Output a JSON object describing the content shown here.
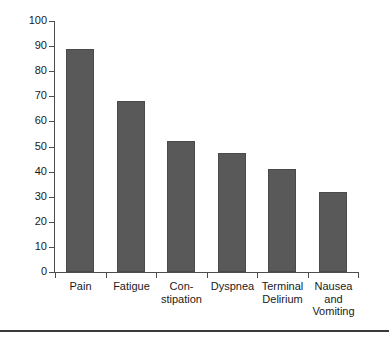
{
  "chart_data": {
    "type": "bar",
    "title": "",
    "subtitle": "",
    "xlabel": "",
    "ylabel": "",
    "categories": [
      "Pain",
      "Fatigue",
      "Con-\nstipation",
      "Dyspnea",
      "Terminal\nDelirium",
      "Nausea\nand\nVomiting"
    ],
    "category_lines": [
      [
        "Pain"
      ],
      [
        "Fatigue"
      ],
      [
        "Con-",
        "stipation"
      ],
      [
        "Dyspnea"
      ],
      [
        "Terminal",
        "Delirium"
      ],
      [
        "Nausea",
        "and",
        "Vomiting"
      ]
    ],
    "values": [
      89,
      68,
      52,
      47.5,
      41,
      32
    ],
    "ylim": [
      0,
      100
    ],
    "ytick_labels": [
      "100",
      "90",
      "80",
      "70",
      "60",
      "50",
      "40",
      "30",
      "20",
      "10",
      "0"
    ],
    "ytick_values": [
      100,
      90,
      80,
      70,
      60,
      50,
      40,
      30,
      20,
      10,
      0
    ],
    "grid": false,
    "legend": null,
    "legend_position": "none",
    "bar_color": "#595959",
    "axis_color": "#4d4d4d",
    "text_color": "#1a1a1a",
    "background": "#ffffff"
  }
}
